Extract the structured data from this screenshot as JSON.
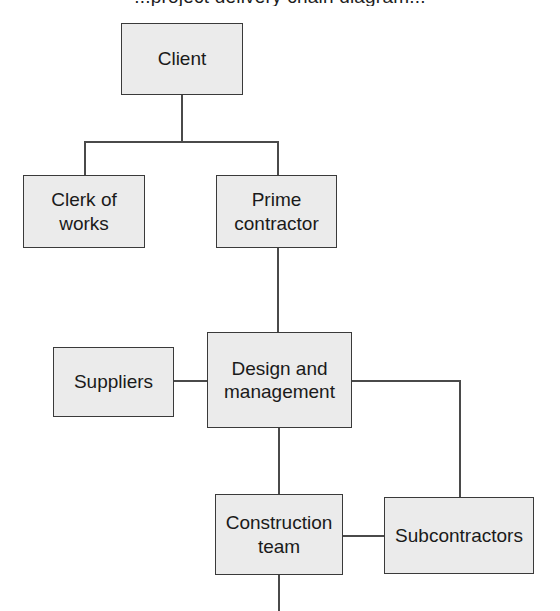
{
  "diagram": {
    "title_partial": "...project delivery chain diagram...",
    "type": "organizational-hierarchy-flowchart",
    "style": {
      "node_fill": "#ebebeb",
      "node_border": "#3a3a3a",
      "connector_color": "#4a4a4a",
      "background": "#ffffff",
      "text_color": "#1a1a1a"
    },
    "nodes": [
      {
        "id": "client",
        "label": "Client",
        "x": 121,
        "y": 23,
        "w": 122,
        "h": 72
      },
      {
        "id": "clerk",
        "label": "Clerk of\nworks",
        "x": 23,
        "y": 175,
        "w": 122,
        "h": 73
      },
      {
        "id": "prime",
        "label": "Prime\ncontractor",
        "x": 216,
        "y": 175,
        "w": 121,
        "h": 73
      },
      {
        "id": "suppliers",
        "label": "Suppliers",
        "x": 53,
        "y": 347,
        "w": 121,
        "h": 70
      },
      {
        "id": "design",
        "label": "Design and\nmanagement",
        "x": 207,
        "y": 332,
        "w": 145,
        "h": 96
      },
      {
        "id": "construction",
        "label": "Construction\nteam",
        "x": 215,
        "y": 494,
        "w": 128,
        "h": 81
      },
      {
        "id": "subcontractors",
        "label": "Subcontractors",
        "x": 384,
        "y": 497,
        "w": 150,
        "h": 77
      }
    ],
    "edges": [
      {
        "id": "client-to-bus",
        "from": "client",
        "to": "split-bus",
        "kind": "vertical"
      },
      {
        "id": "bus-horizontal",
        "from": "clerk",
        "to": "prime",
        "kind": "horizontal"
      },
      {
        "id": "bus-to-clerk",
        "from": "split-bus",
        "to": "clerk",
        "kind": "vertical"
      },
      {
        "id": "bus-to-prime",
        "from": "split-bus",
        "to": "prime",
        "kind": "vertical"
      },
      {
        "id": "prime-to-design",
        "from": "prime",
        "to": "design",
        "kind": "vertical"
      },
      {
        "id": "suppliers-to-design",
        "from": "suppliers",
        "to": "design",
        "kind": "horizontal"
      },
      {
        "id": "design-to-construction",
        "from": "design",
        "to": "construction",
        "kind": "vertical"
      },
      {
        "id": "design-to-subcontractors",
        "from": "design",
        "to": "subcontractors",
        "kind": "elbow"
      },
      {
        "id": "construction-to-subs",
        "from": "construction",
        "to": "subcontractors",
        "kind": "horizontal"
      },
      {
        "id": "construction-stub-down",
        "from": "construction",
        "to": "off-page",
        "kind": "vertical"
      }
    ]
  }
}
